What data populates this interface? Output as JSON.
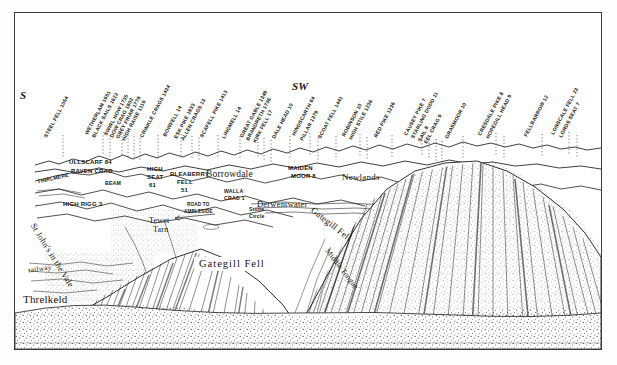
{
  "document": {
    "title": "Blencathra Panorama",
    "medium": "pen-and-ink panorama drawing",
    "frame_color": "#3a3a38",
    "paper_color": "#ffffff",
    "ink_color": "#1a1a1a"
  },
  "compass": [
    {
      "label": "S",
      "x": 19,
      "y": 88
    },
    {
      "label": "SW",
      "x": 291,
      "y": 79
    }
  ],
  "skyline_labels": [
    {
      "text": "STEEL FELL 1054",
      "x": 44,
      "y": 133
    },
    {
      "text": "WETHERLAM 1651",
      "x": 85,
      "y": 130
    },
    {
      "text": "BLACK SAILS 1622",
      "x": 92,
      "y": 133
    },
    {
      "text": "SWIRL HOW 1735",
      "x": 104,
      "y": 131
    },
    {
      "text": "DOW CRAG 1802",
      "x": 110,
      "y": 133
    },
    {
      "text": "GREY FRIAR 1778",
      "x": 116,
      "y": 134
    },
    {
      "text": "HIGH RAISE 1119",
      "x": 122,
      "y": 136
    },
    {
      "text": "CRINKLE CRAGS 1434",
      "x": 140,
      "y": 133
    },
    {
      "text": "BOWFELL 14",
      "x": 163,
      "y": 132
    },
    {
      "text": "ESK PIKE 1933",
      "x": 174,
      "y": 134
    },
    {
      "text": "ALLEN CRAGS 13",
      "x": 181,
      "y": 136
    },
    {
      "text": "SCAFELL PIKE 1413",
      "x": 200,
      "y": 133
    },
    {
      "text": "LINGMELL 14",
      "x": 222,
      "y": 134
    },
    {
      "text": "GREAT GABLE 1349",
      "x": 240,
      "y": 133
    },
    {
      "text": "BRANDRETH 1736",
      "x": 246,
      "y": 136
    },
    {
      "text": "KIRK FELL 17",
      "x": 253,
      "y": 138
    },
    {
      "text": "DALE HEAD 10",
      "x": 272,
      "y": 134
    },
    {
      "text": "HINDSCARTH 94",
      "x": 292,
      "y": 131
    },
    {
      "text": "PILLAR 1379",
      "x": 300,
      "y": 136
    },
    {
      "text": "SCOAT FELL 1441",
      "x": 318,
      "y": 134
    },
    {
      "text": "ROBINSON 10",
      "x": 342,
      "y": 132
    },
    {
      "text": "HIGH STILE 1236",
      "x": 349,
      "y": 135
    },
    {
      "text": "RED PIKE 1236",
      "x": 374,
      "y": 133
    },
    {
      "text": "CAUSEY PIKE 7",
      "x": 404,
      "y": 131
    },
    {
      "text": "STARLING DODD 11",
      "x": 411,
      "y": 134
    },
    {
      "text": "SAIL 8",
      "x": 418,
      "y": 137
    },
    {
      "text": "EEL CRAG 9",
      "x": 424,
      "y": 139
    },
    {
      "text": "GRASMOOR 10",
      "x": 445,
      "y": 134
    },
    {
      "text": "CRESDALE PIKE 8",
      "x": 478,
      "y": 131
    },
    {
      "text": "HOPEGILL HEAD 9",
      "x": 486,
      "y": 134
    },
    {
      "text": "FELLBARROW 12",
      "x": 524,
      "y": 132
    },
    {
      "text": "LONSCALE FELL 23",
      "x": 551,
      "y": 130
    },
    {
      "text": "LORDS SEAT 7",
      "x": 559,
      "y": 133
    }
  ],
  "valley_labels": [
    {
      "text": "ULLSCARF 84",
      "x": 68,
      "y": 158,
      "size": "normal"
    },
    {
      "text": "RAVEN CRAG",
      "x": 70,
      "y": 167,
      "size": "normal"
    },
    {
      "text": "THIRLMERE",
      "x": 36,
      "y": 174,
      "size": "small",
      "rotate": -13
    },
    {
      "text": "BEAM",
      "x": 104,
      "y": 179,
      "size": "small"
    },
    {
      "text": "HIGH RIGG 3",
      "x": 62,
      "y": 200,
      "size": "normal"
    },
    {
      "text": "HIGH",
      "x": 146,
      "y": 165,
      "size": "normal"
    },
    {
      "text": "SEAT",
      "x": 146,
      "y": 173,
      "size": "normal"
    },
    {
      "text": "61",
      "x": 148,
      "y": 181,
      "size": "normal"
    },
    {
      "text": "BLEABERRY",
      "x": 169,
      "y": 170,
      "size": "normal"
    },
    {
      "text": "FELL",
      "x": 176,
      "y": 178,
      "size": "normal"
    },
    {
      "text": "51",
      "x": 180,
      "y": 186,
      "size": "normal"
    },
    {
      "text": "MAIDEN",
      "x": 287,
      "y": 164,
      "size": "normal"
    },
    {
      "text": "MOOR 8",
      "x": 290,
      "y": 172,
      "size": "normal"
    },
    {
      "text": "WALLA",
      "x": 223,
      "y": 187,
      "size": "small"
    },
    {
      "text": "CRAG 1",
      "x": 223,
      "y": 194,
      "size": "small"
    },
    {
      "text": "Stone",
      "x": 248,
      "y": 205,
      "size": "small"
    },
    {
      "text": "Circle",
      "x": 248,
      "y": 212,
      "size": "small"
    }
  ],
  "script_labels": [
    {
      "text": "Borrowdale",
      "x": 205,
      "y": 168,
      "size": 9.5
    },
    {
      "text": "Newlands",
      "x": 341,
      "y": 171,
      "size": 9
    },
    {
      "text": "Derwentwater",
      "x": 256,
      "y": 198,
      "size": 8.5
    },
    {
      "text": "Tewet",
      "x": 148,
      "y": 215,
      "size": 8
    },
    {
      "text": "Tarn",
      "x": 152,
      "y": 224,
      "size": 8
    },
    {
      "text": "Threlkeld",
      "x": 22,
      "y": 292,
      "size": 11
    },
    {
      "text": "railway",
      "x": 27,
      "y": 263,
      "size": 7.4,
      "rotate": -8
    }
  ],
  "road_labels": [
    {
      "text": "ROAD TO",
      "x": 186,
      "y": 201
    },
    {
      "text": "AMBLESIDE",
      "x": 183,
      "y": 208
    }
  ],
  "diagonal_labels": [
    {
      "text": "St John's in the Vale",
      "x": 32,
      "y": 218,
      "rotate": 58,
      "size": 8.6
    },
    {
      "text": "Gategill Fell",
      "x": 311,
      "y": 203,
      "rotate": 38,
      "size": 9.2
    },
    {
      "text": "Middle Tongue",
      "x": 326,
      "y": 244,
      "rotate": 52,
      "size": 7.6
    }
  ],
  "boxed_labels": [
    {
      "text": "Gategill Fell",
      "x": 193,
      "y": 256
    }
  ],
  "leader_lines": {
    "style": "dotted",
    "color": "#4a4a46",
    "count": 33
  }
}
